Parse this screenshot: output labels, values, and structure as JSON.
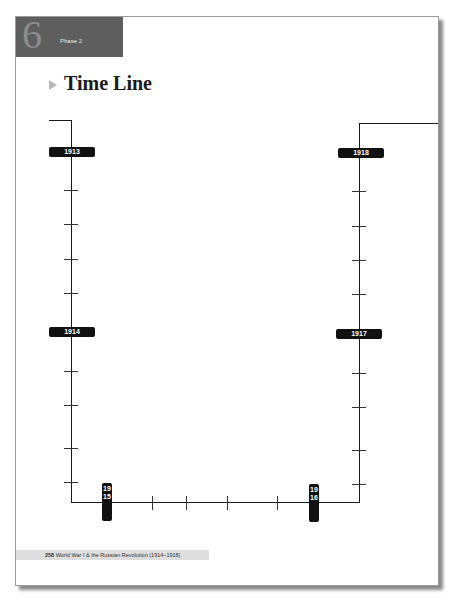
{
  "header": {
    "chapter_number": "6",
    "phase_label": "Phase 2"
  },
  "title": "Time Line",
  "timeline": {
    "years_left": [
      "1913",
      "1914"
    ],
    "years_bottom": [
      "1915",
      "1916"
    ],
    "years_right": [
      "1917",
      "1918"
    ],
    "labels": {
      "y1913": "1913",
      "y1914": "1914",
      "y1915": "1915",
      "y1916": "1916",
      "y1917": "1917",
      "y1918": "1918"
    }
  },
  "footer": {
    "page_number": "258",
    "text": "World War I & the Russian Revolution (1914–1918)"
  }
}
